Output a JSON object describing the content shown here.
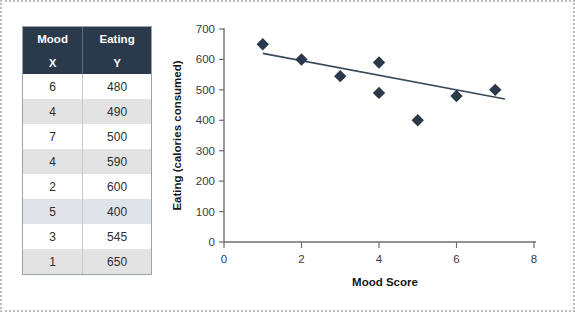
{
  "figure": {
    "border_color": "#b9bfc4",
    "background": "#ffffff"
  },
  "table": {
    "name": "mood-eating-data-table",
    "header_bg": "#2b3a4a",
    "header_fg": "#ffffff",
    "columns": [
      "Mood",
      "Eating"
    ],
    "subheaders": [
      "X",
      "Y"
    ],
    "rows": [
      {
        "x": "6",
        "y": "480"
      },
      {
        "x": "4",
        "y": "490"
      },
      {
        "x": "7",
        "y": "500"
      },
      {
        "x": "4",
        "y": "590"
      },
      {
        "x": "2",
        "y": "600"
      },
      {
        "x": "5",
        "y": "400"
      },
      {
        "x": "3",
        "y": "545"
      },
      {
        "x": "1",
        "y": "650"
      }
    ]
  },
  "chart_data": {
    "type": "scatter",
    "title": "",
    "xlabel": "Mood Score",
    "ylabel": "Eating (calories consumed)",
    "xlim": [
      0,
      8
    ],
    "ylim": [
      0,
      700
    ],
    "xticks": [
      0,
      2,
      4,
      6,
      8
    ],
    "yticks": [
      0,
      100,
      200,
      300,
      400,
      500,
      600,
      700
    ],
    "xticklabels": [
      "0",
      "2",
      "4",
      "6",
      "8"
    ],
    "yticklabels": [
      "0",
      "100",
      "200",
      "300",
      "400",
      "500",
      "600",
      "700"
    ],
    "grid": false,
    "legend": false,
    "marker_shape": "diamond",
    "marker_color": "#2b3a4a",
    "trendline_color": "#394a5a",
    "points": [
      {
        "x": 1,
        "y": 650
      },
      {
        "x": 2,
        "y": 600
      },
      {
        "x": 3,
        "y": 545
      },
      {
        "x": 4,
        "y": 590
      },
      {
        "x": 4,
        "y": 490
      },
      {
        "x": 5,
        "y": 400
      },
      {
        "x": 6,
        "y": 480
      },
      {
        "x": 7,
        "y": 500
      }
    ],
    "trendline": {
      "x1": 1.0,
      "y1": 620,
      "x2": 7.25,
      "y2": 470
    }
  }
}
